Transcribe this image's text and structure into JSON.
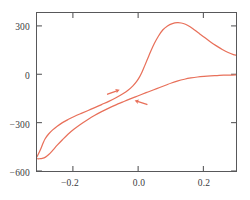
{
  "chart_data": {
    "type": "line",
    "title": "",
    "subtitle": "",
    "xlabel": "E/V",
    "ylabel": "I/µA",
    "xlabel_parts": {
      "symbol": "E",
      "slash": "/",
      "unit": "V"
    },
    "ylabel_parts": {
      "symbol": "I",
      "slash": "/",
      "unit": "µA"
    },
    "xlim": [
      -0.31,
      0.3
    ],
    "ylim": [
      -600,
      380
    ],
    "xticks": [
      -0.2,
      0.0,
      0.2
    ],
    "xtick_labels": [
      "−0.2",
      "0.0",
      "0.2"
    ],
    "yticks": [
      300,
      0,
      -300,
      -600
    ],
    "ytick_labels": [
      "300",
      "0",
      "−300",
      "−600"
    ],
    "grid": false,
    "legend": "none",
    "curve_color": "#e8705a",
    "axis_color": "#58585a",
    "text_color": "#3a3a3c",
    "series": [
      {
        "name": "forward-scan",
        "direction": "anodic",
        "arrow": "right",
        "points": [
          [
            -0.31,
            -512
          ],
          [
            -0.3,
            -470
          ],
          [
            -0.292,
            -430
          ],
          [
            -0.285,
            -400
          ],
          [
            -0.275,
            -372
          ],
          [
            -0.262,
            -345
          ],
          [
            -0.248,
            -322
          ],
          [
            -0.232,
            -300
          ],
          [
            -0.215,
            -281
          ],
          [
            -0.196,
            -262
          ],
          [
            -0.176,
            -244
          ],
          [
            -0.155,
            -226
          ],
          [
            -0.133,
            -207
          ],
          [
            -0.112,
            -188
          ],
          [
            -0.09,
            -168
          ],
          [
            -0.068,
            -146
          ],
          [
            -0.048,
            -123
          ],
          [
            -0.03,
            -98
          ],
          [
            -0.016,
            -72
          ],
          [
            -0.005,
            -46
          ],
          [
            0.004,
            -18
          ],
          [
            0.012,
            14
          ],
          [
            0.02,
            52
          ],
          [
            0.029,
            96
          ],
          [
            0.039,
            144
          ],
          [
            0.05,
            192
          ],
          [
            0.062,
            236
          ],
          [
            0.076,
            276
          ],
          [
            0.09,
            300
          ],
          [
            0.105,
            314
          ],
          [
            0.12,
            320
          ],
          [
            0.132,
            318
          ],
          [
            0.145,
            310
          ],
          [
            0.158,
            296
          ],
          [
            0.172,
            276
          ],
          [
            0.188,
            252
          ],
          [
            0.205,
            226
          ],
          [
            0.222,
            200
          ],
          [
            0.24,
            176
          ],
          [
            0.258,
            154
          ],
          [
            0.276,
            135
          ],
          [
            0.292,
            122
          ],
          [
            0.3,
            118
          ]
        ]
      },
      {
        "name": "reverse-scan",
        "direction": "cathodic",
        "arrow": "left",
        "points": [
          [
            0.3,
            -4
          ],
          [
            0.282,
            -5
          ],
          [
            0.262,
            -6
          ],
          [
            0.242,
            -8
          ],
          [
            0.222,
            -10
          ],
          [
            0.202,
            -13
          ],
          [
            0.182,
            -17
          ],
          [
            0.162,
            -23
          ],
          [
            0.142,
            -31
          ],
          [
            0.122,
            -41
          ],
          [
            0.102,
            -54
          ],
          [
            0.084,
            -68
          ],
          [
            0.066,
            -82
          ],
          [
            0.048,
            -96
          ],
          [
            0.03,
            -110
          ],
          [
            0.012,
            -124
          ],
          [
            -0.008,
            -140
          ],
          [
            -0.028,
            -156
          ],
          [
            -0.048,
            -173
          ],
          [
            -0.068,
            -190
          ],
          [
            -0.09,
            -210
          ],
          [
            -0.112,
            -232
          ],
          [
            -0.134,
            -256
          ],
          [
            -0.155,
            -282
          ],
          [
            -0.176,
            -310
          ],
          [
            -0.196,
            -340
          ],
          [
            -0.215,
            -372
          ],
          [
            -0.232,
            -406
          ],
          [
            -0.248,
            -440
          ],
          [
            -0.262,
            -472
          ],
          [
            -0.274,
            -498
          ],
          [
            -0.284,
            -514
          ],
          [
            -0.294,
            -522
          ],
          [
            -0.302,
            -524
          ],
          [
            -0.31,
            -524
          ]
        ]
      }
    ],
    "annotations": [
      {
        "name": "forward-scan-arrow",
        "label": "",
        "direction": "right",
        "x": -0.075,
        "y": -110
      },
      {
        "name": "reverse-scan-arrow",
        "label": "",
        "direction": "left",
        "x": 0.008,
        "y": -175
      }
    ],
    "peaks": [
      {
        "name": "anodic-peak",
        "x": 0.125,
        "y": 320
      }
    ]
  }
}
